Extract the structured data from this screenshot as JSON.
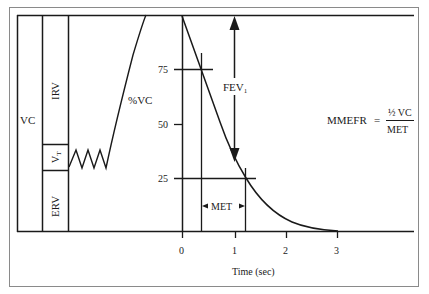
{
  "diagram": {
    "volume_labels": {
      "vc": "VC",
      "irv": "IRV",
      "vt": "V",
      "vt_sub": "T",
      "erv": "ERV",
      "pct_vc": "%VC"
    },
    "y_ticks": [
      {
        "label": "75",
        "value": 75
      },
      {
        "label": "50",
        "value": 50
      },
      {
        "label": "25",
        "value": 25
      }
    ],
    "x_ticks": [
      {
        "label": "0",
        "value": 0
      },
      {
        "label": "1",
        "value": 1
      },
      {
        "label": "2",
        "value": 2
      },
      {
        "label": "3",
        "value": 3
      }
    ],
    "x_axis_label": "Time (sec)",
    "fev1": {
      "label": "FEV",
      "sub": "1"
    },
    "met_label": "MET",
    "formula": {
      "lhs": "MMEFR",
      "equals": "=",
      "numerator": "½ VC",
      "denominator": "MET"
    },
    "colors": {
      "line": "#1a1a1a",
      "frame": "#888888",
      "background": "#ffffff"
    }
  }
}
